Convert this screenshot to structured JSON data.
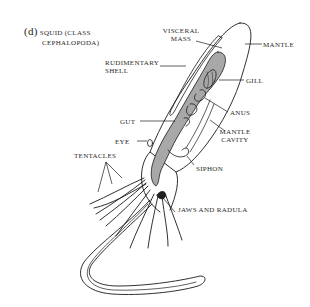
{
  "figure": {
    "panel_letter": "(d)",
    "title_line1": "SQUID (CLASS",
    "title_line2": "CEPHALOPODA)"
  },
  "labels": {
    "visceral_mass_1": "VISCERAL",
    "visceral_mass_2": "MASS",
    "mantle": "MANTLE",
    "rudimentary_shell_1": "RUDIMENTARY",
    "rudimentary_shell_2": "SHELL",
    "gill": "GILL",
    "anus": "ANUS",
    "gut": "GUT",
    "mantle_cavity_1": "MANTLE",
    "mantle_cavity_2": "CAVITY",
    "eye": "EYE",
    "siphon": "SIPHON",
    "tentacles": "TENTACLES",
    "jaws_and_radula": "JAWS AND RADULA"
  },
  "colors": {
    "outline": "#1a1a1a",
    "visceral_fill": "#a8a8a8",
    "background": "#ffffff"
  }
}
